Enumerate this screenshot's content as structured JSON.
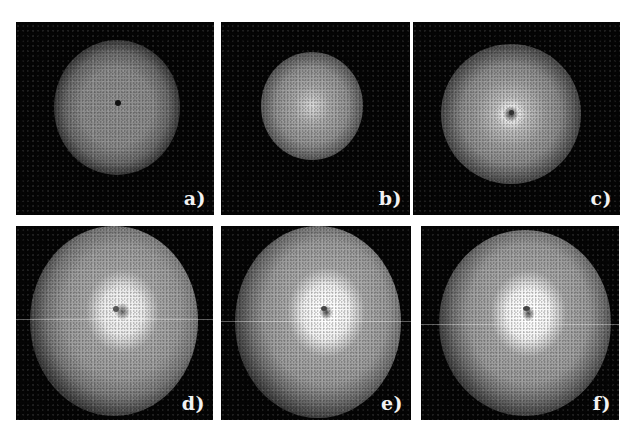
{
  "figure": {
    "panels": [
      {
        "id": "a",
        "label": "a)",
        "description": "diffuse gray speckle cloud with dark center dot"
      },
      {
        "id": "b",
        "label": "b)",
        "description": "smaller bright speckle cloud with bright center"
      },
      {
        "id": "c",
        "label": "c)",
        "description": "speckle cloud with bright ring around dark center"
      },
      {
        "id": "d",
        "label": "d)",
        "description": "large speckle cloud with bright white core and dark center dot"
      },
      {
        "id": "e",
        "label": "e)",
        "description": "large elliptical speckle cloud with bright white core"
      },
      {
        "id": "f",
        "label": "f)",
        "description": "largest elliptical speckle cloud with bright white core"
      }
    ],
    "colors": {
      "background": "#ffffff",
      "panel_background": "#050505",
      "label_color": "#f2f2f2"
    }
  }
}
